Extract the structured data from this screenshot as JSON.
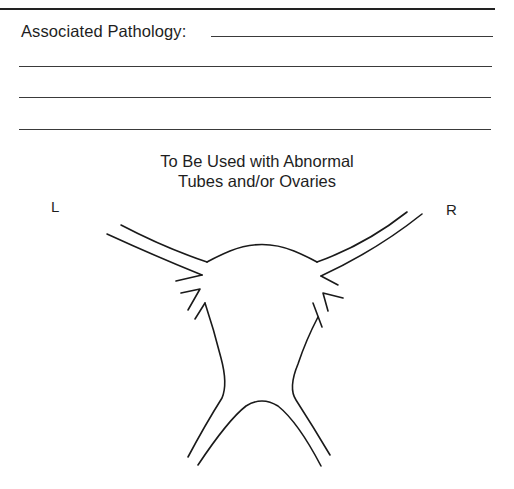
{
  "form": {
    "pathology_label": "Associated Pathology:",
    "pathology_value": "",
    "extra_lines": [
      "",
      "",
      ""
    ]
  },
  "diagram": {
    "title_line1": "To Be Used with Abnormal",
    "title_line2": "Tubes and/or Ovaries",
    "left_label": "L",
    "right_label": "R"
  },
  "colors": {
    "ink": "#1a1a1a",
    "background": "#ffffff"
  }
}
